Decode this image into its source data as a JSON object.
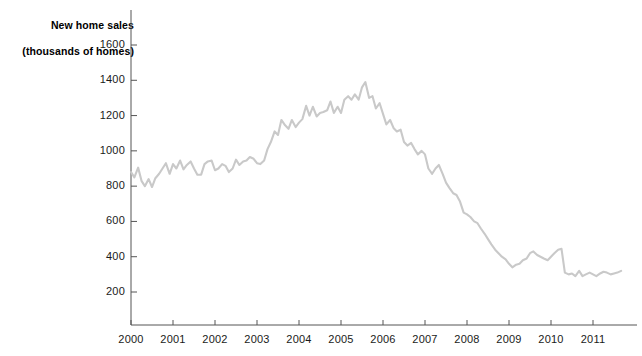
{
  "chart_data": {
    "type": "line",
    "title": "New home sales",
    "subtitle": "(thousands of homes)",
    "xlabel": "",
    "ylabel": "thousands of homes",
    "grid": false,
    "legend": null,
    "line_color": "#c9c9c9",
    "axis_color": "#555555",
    "background": "#ffffff",
    "xlim": [
      2000.0,
      2011.75
    ],
    "ylim": [
      100,
      1700
    ],
    "yticks": [
      200,
      400,
      600,
      800,
      1000,
      1200,
      1400,
      1600
    ],
    "ytick_labels": [
      "200",
      "400",
      "600",
      "800",
      "1000",
      "1200",
      "1400",
      "1600"
    ],
    "xticks": [
      2000,
      2001,
      2002,
      2003,
      2004,
      2005,
      2006,
      2007,
      2008,
      2009,
      2010,
      2011
    ],
    "xtick_labels": [
      "2000",
      "2001",
      "2002",
      "2003",
      "2004",
      "2005",
      "2006",
      "2007",
      "2008",
      "2009",
      "2010",
      "2011"
    ],
    "series": [
      {
        "name": "New home sales",
        "x": [
          2000.0,
          2000.08,
          2000.17,
          2000.25,
          2000.33,
          2000.42,
          2000.5,
          2000.58,
          2000.67,
          2000.75,
          2000.83,
          2000.92,
          2001.0,
          2001.08,
          2001.17,
          2001.25,
          2001.33,
          2001.42,
          2001.5,
          2001.58,
          2001.67,
          2001.75,
          2001.83,
          2001.92,
          2002.0,
          2002.08,
          2002.17,
          2002.25,
          2002.33,
          2002.42,
          2002.5,
          2002.58,
          2002.67,
          2002.75,
          2002.83,
          2002.92,
          2003.0,
          2003.08,
          2003.17,
          2003.25,
          2003.33,
          2003.42,
          2003.5,
          2003.58,
          2003.67,
          2003.75,
          2003.83,
          2003.92,
          2004.0,
          2004.08,
          2004.17,
          2004.25,
          2004.33,
          2004.42,
          2004.5,
          2004.58,
          2004.67,
          2004.75,
          2004.83,
          2004.92,
          2005.0,
          2005.08,
          2005.17,
          2005.25,
          2005.33,
          2005.42,
          2005.5,
          2005.58,
          2005.67,
          2005.75,
          2005.83,
          2005.92,
          2006.0,
          2006.08,
          2006.17,
          2006.25,
          2006.33,
          2006.42,
          2006.5,
          2006.58,
          2006.67,
          2006.75,
          2006.83,
          2006.92,
          2007.0,
          2007.08,
          2007.17,
          2007.25,
          2007.33,
          2007.42,
          2007.5,
          2007.58,
          2007.67,
          2007.75,
          2007.83,
          2007.92,
          2008.0,
          2008.08,
          2008.17,
          2008.25,
          2008.33,
          2008.42,
          2008.5,
          2008.58,
          2008.67,
          2008.75,
          2008.83,
          2008.92,
          2009.0,
          2009.08,
          2009.17,
          2009.25,
          2009.33,
          2009.42,
          2009.5,
          2009.58,
          2009.67,
          2009.75,
          2009.83,
          2009.92,
          2010.0,
          2010.08,
          2010.17,
          2010.25,
          2010.33,
          2010.42,
          2010.5,
          2010.58,
          2010.67,
          2010.75,
          2010.83,
          2010.92,
          2011.0,
          2011.08,
          2011.17,
          2011.25,
          2011.33,
          2011.42,
          2011.5,
          2011.58,
          2011.67
        ],
        "values": [
          880,
          850,
          905,
          830,
          800,
          840,
          795,
          845,
          870,
          900,
          930,
          870,
          925,
          900,
          945,
          895,
          920,
          940,
          900,
          865,
          865,
          925,
          940,
          945,
          890,
          900,
          925,
          915,
          880,
          900,
          950,
          920,
          940,
          945,
          965,
          955,
          930,
          925,
          945,
          1010,
          1050,
          1110,
          1090,
          1175,
          1145,
          1125,
          1175,
          1135,
          1160,
          1180,
          1255,
          1200,
          1250,
          1195,
          1215,
          1220,
          1230,
          1280,
          1215,
          1250,
          1215,
          1290,
          1310,
          1290,
          1320,
          1290,
          1360,
          1390,
          1300,
          1310,
          1240,
          1270,
          1210,
          1150,
          1175,
          1130,
          1110,
          1120,
          1050,
          1030,
          1045,
          1010,
          980,
          1000,
          980,
          900,
          870,
          900,
          920,
          870,
          820,
          790,
          760,
          750,
          715,
          650,
          640,
          625,
          600,
          590,
          560,
          530,
          500,
          470,
          440,
          420,
          400,
          385,
          360,
          340,
          355,
          360,
          380,
          390,
          420,
          430,
          410,
          400,
          390,
          380,
          400,
          420,
          440,
          445,
          310,
          300,
          305,
          290,
          320,
          290,
          300,
          310,
          300,
          290,
          305,
          315,
          310,
          300,
          305,
          310,
          320
        ]
      }
    ]
  },
  "axis": {
    "title_line1": "New home sales",
    "title_line2": "(thousands of homes)"
  }
}
